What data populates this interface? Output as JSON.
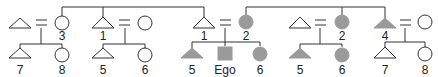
{
  "diagram": {
    "colors": {
      "line": "#333333",
      "fill": "#9a9a9a",
      "outline": "#333333",
      "background": "#ffffff"
    },
    "people": [
      {
        "id": "a_husband",
        "shape": "triangle",
        "filled": false,
        "label": "",
        "x": 20,
        "row": "top"
      },
      {
        "id": "a_wife",
        "shape": "circle",
        "filled": false,
        "label": "3",
        "x": 62,
        "row": "top"
      },
      {
        "id": "a_child_7",
        "shape": "triangle",
        "filled": false,
        "label": "7",
        "x": 20,
        "row": "bottom"
      },
      {
        "id": "a_child_8",
        "shape": "circle",
        "filled": false,
        "label": "8",
        "x": 62,
        "row": "bottom"
      },
      {
        "id": "b_husband",
        "shape": "triangle",
        "filled": false,
        "label": "1",
        "x": 103,
        "row": "top"
      },
      {
        "id": "b_wife",
        "shape": "circle",
        "filled": false,
        "label": "",
        "x": 145,
        "row": "top"
      },
      {
        "id": "b_child_5",
        "shape": "triangle",
        "filled": false,
        "label": "5",
        "x": 103,
        "row": "bottom"
      },
      {
        "id": "b_child_6",
        "shape": "circle",
        "filled": false,
        "label": "6",
        "x": 145,
        "row": "bottom"
      },
      {
        "id": "c_husband",
        "shape": "triangle",
        "filled": false,
        "label": "1",
        "x": 204,
        "row": "top"
      },
      {
        "id": "c_wife",
        "shape": "circle",
        "filled": true,
        "label": "2",
        "x": 246,
        "row": "top"
      },
      {
        "id": "c_child_5",
        "shape": "triangle",
        "filled": true,
        "label": "5",
        "x": 192,
        "row": "bottom"
      },
      {
        "id": "ego",
        "shape": "square",
        "filled": true,
        "label": "Ego",
        "x": 225,
        "row": "bottom"
      },
      {
        "id": "c_child_6",
        "shape": "circle",
        "filled": true,
        "label": "6",
        "x": 260,
        "row": "bottom"
      },
      {
        "id": "d_husband",
        "shape": "triangle",
        "filled": false,
        "label": "",
        "x": 300,
        "row": "top"
      },
      {
        "id": "d_wife",
        "shape": "circle",
        "filled": true,
        "label": "2",
        "x": 342,
        "row": "top"
      },
      {
        "id": "d_child_5",
        "shape": "triangle",
        "filled": true,
        "label": "5",
        "x": 300,
        "row": "bottom"
      },
      {
        "id": "d_child_6",
        "shape": "circle",
        "filled": true,
        "label": "6",
        "x": 342,
        "row": "bottom"
      },
      {
        "id": "e_husband",
        "shape": "triangle",
        "filled": true,
        "label": "4",
        "x": 385,
        "row": "top"
      },
      {
        "id": "e_wife",
        "shape": "circle",
        "filled": false,
        "label": "",
        "x": 425,
        "row": "top"
      },
      {
        "id": "e_child_7",
        "shape": "triangle",
        "filled": false,
        "label": "7",
        "x": 385,
        "row": "bottom"
      },
      {
        "id": "e_child_8",
        "shape": "circle",
        "filled": false,
        "label": "8",
        "x": 425,
        "row": "bottom"
      }
    ],
    "marriage_symbol": "=",
    "labels": {
      "a_wife": "3",
      "a_child_7": "7",
      "a_child_8": "8",
      "b_husband": "1",
      "b_child_5": "5",
      "b_child_6": "6",
      "c_husband": "1",
      "c_wife": "2",
      "c_child_5": "5",
      "ego": "Ego",
      "c_child_6": "6",
      "d_wife": "2",
      "d_child_5": "5",
      "d_child_6": "6",
      "e_husband": "4",
      "e_child_7": "7",
      "e_child_8": "8"
    }
  }
}
